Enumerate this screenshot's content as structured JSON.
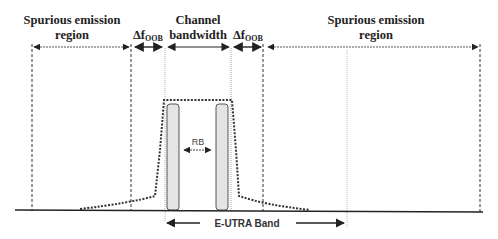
{
  "diagram": {
    "labels": {
      "spurious_left_line1": "Spurious emission",
      "spurious_left_line2": "region",
      "oob_left_delta": "Δf",
      "oob_left_sub": "OOB",
      "channel_line1": "Channel",
      "channel_line2": "bandwidth",
      "oob_right_delta": "Δf",
      "oob_right_sub": "OOB",
      "spurious_right_line1": "Spurious emission",
      "spurious_right_line2": "region",
      "rb": "RB",
      "band": "E-UTRA Band"
    },
    "regions": [
      {
        "name": "Spurious emission region (left)",
        "x_start": 32,
        "x_end": 131
      },
      {
        "name": "ΔfOOB (left)",
        "x_start": 131,
        "x_end": 165
      },
      {
        "name": "Channel bandwidth",
        "x_start": 165,
        "x_end": 231
      },
      {
        "name": "ΔfOOB (right)",
        "x_start": 231,
        "x_end": 263
      },
      {
        "name": "Spurious emission region (right)",
        "x_start": 263,
        "x_end": 480
      }
    ],
    "colors": {
      "line": "#222222",
      "rb_fill": "#e4e4e4",
      "background": "#ffffff"
    }
  }
}
